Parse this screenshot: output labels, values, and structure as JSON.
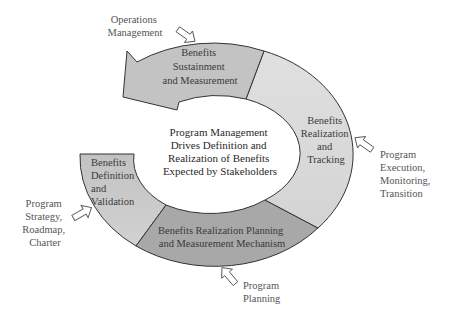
{
  "diagram": {
    "center_text": [
      "Program Management",
      "Drives Definition and",
      "Realization of Benefits",
      "Expected by Stakeholders"
    ],
    "segments": [
      {
        "id": "definition",
        "lines": [
          "Benefits",
          "Definition",
          "and",
          "Validation"
        ],
        "color": "#c8c8c8"
      },
      {
        "id": "planning",
        "lines": [
          "Benefits Realization Planning",
          "and Measurement Mechanism"
        ],
        "color": "#a9a9a9"
      },
      {
        "id": "tracking",
        "lines": [
          "Benefits",
          "Realization",
          "and",
          "Tracking"
        ],
        "color": "#dcdcdc"
      },
      {
        "id": "sustainment",
        "lines": [
          "Benefits",
          "Sustainment",
          "and Measurement"
        ],
        "color": "#c4c4c4"
      }
    ],
    "inputs": [
      {
        "id": "operations",
        "lines": [
          "Operations",
          "Management"
        ]
      },
      {
        "id": "execution",
        "lines": [
          "Program",
          "Execution,",
          "Monitoring,",
          "Transition"
        ]
      },
      {
        "id": "planning",
        "lines": [
          "Program",
          "Planning"
        ]
      },
      {
        "id": "strategy",
        "lines": [
          "Program",
          "Strategy,",
          "Roadmap,",
          "Charter"
        ]
      }
    ],
    "stroke_color": "#333333"
  }
}
